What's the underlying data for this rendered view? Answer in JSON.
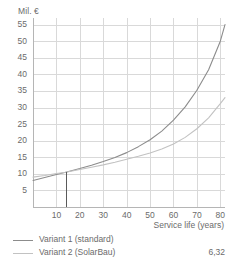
{
  "chart_data": {
    "type": "line",
    "title": "",
    "xlabel": "Service life (years)",
    "ylabel": "Mil. €",
    "xlim": [
      0,
      82
    ],
    "ylim": [
      0,
      57
    ],
    "grid": true,
    "xticks": [
      10,
      20,
      30,
      40,
      50,
      60,
      70,
      80
    ],
    "yticks": [
      5,
      10,
      15,
      20,
      25,
      30,
      35,
      40,
      45,
      50,
      55
    ],
    "x": [
      0,
      5,
      10,
      14,
      20,
      25,
      30,
      35,
      40,
      45,
      50,
      55,
      60,
      65,
      70,
      75,
      80,
      82
    ],
    "series": [
      {
        "name": "Variant 1 (standard)",
        "color": "#8c8c8c",
        "values": [
          8.0,
          8.9,
          9.8,
          10.5,
          11.6,
          12.6,
          13.7,
          14.9,
          16.4,
          18.2,
          20.3,
          22.9,
          26.2,
          30.2,
          35.2,
          41.4,
          50.0,
          55.0
        ]
      },
      {
        "name": "Variant 2 (SolarBau)",
        "color": "#c2c2c2",
        "values": [
          9.0,
          9.5,
          10.1,
          10.5,
          11.3,
          12.0,
          12.7,
          13.5,
          14.4,
          15.3,
          16.3,
          17.5,
          19.0,
          21.0,
          23.6,
          26.9,
          31.2,
          33.0
        ]
      }
    ],
    "marker_line": {
      "name": "break-even-marker",
      "x": 14,
      "y_from": 0,
      "y_to": 10.5,
      "color": "#5a5a5a"
    },
    "legend_position": "bottom-left",
    "legend": [
      {
        "label": "Variant 1 (standard)",
        "value": ""
      },
      {
        "label": "Variant 2 (SolarBau)",
        "value": "6,32"
      }
    ],
    "colors": {
      "grid": "#d9d9d9",
      "axis": "#b5b5b5",
      "text": "#6b6b6b",
      "series1": "#8c8c8c",
      "series2": "#c2c2c2",
      "marker": "#5a5a5a",
      "background": "#ffffff"
    }
  }
}
